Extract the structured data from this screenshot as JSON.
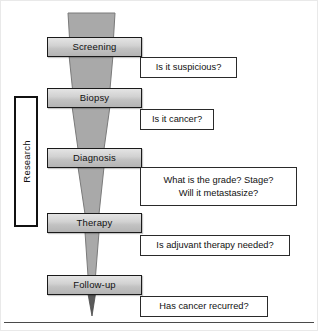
{
  "figure": {
    "width": 318,
    "height": 331,
    "background_color": "#ffffff"
  },
  "colors": {
    "funnel_fill": "#a9a9a9",
    "funnel_stroke": "#6e6e6e",
    "stage_fill_top": "#e4e4e4",
    "stage_fill_bottom": "#b4b4b4",
    "stage_stroke": "#1a1a1a",
    "callout_fill": "#ffffff",
    "callout_stroke": "#2a2a2a",
    "text_color": "#111111",
    "rule_color": "#4a4a4a"
  },
  "research_bracket": {
    "label": "Research",
    "orientation": "vertical-rotated-90"
  },
  "stages": [
    {
      "id": "screening",
      "label": "Screening"
    },
    {
      "id": "biopsy",
      "label": "Biopsy"
    },
    {
      "id": "diagnosis",
      "label": "Diagnosis"
    },
    {
      "id": "therapy",
      "label": "Therapy"
    },
    {
      "id": "followup",
      "label": "Follow-up"
    }
  ],
  "callouts": [
    {
      "id": "callout-screening",
      "text": "Is it suspicious?"
    },
    {
      "id": "callout-biopsy",
      "text": "Is it cancer?"
    },
    {
      "id": "callout-diagnosis",
      "text": "What is the grade? Stage?\nWill it metastasize?"
    },
    {
      "id": "callout-therapy",
      "text": "Is adjuvant therapy needed?"
    },
    {
      "id": "callout-followup",
      "text": "Has cancer recurred?"
    }
  ]
}
